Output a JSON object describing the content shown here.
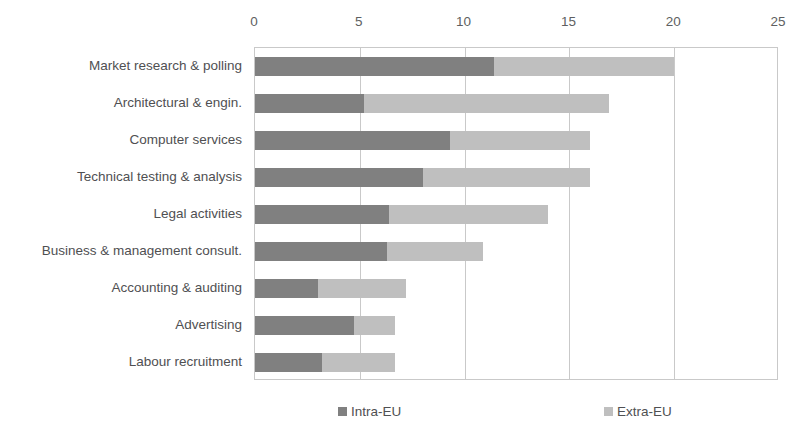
{
  "chart_data": {
    "type": "bar",
    "orientation": "horizontal",
    "stacked": true,
    "title": "",
    "xlabel": "",
    "ylabel": "",
    "xlim": [
      0,
      25
    ],
    "xticks": [
      0,
      5,
      10,
      15,
      20,
      25
    ],
    "xtick_labels": [
      "0",
      "5",
      "10",
      "15",
      "20",
      "25"
    ],
    "grid": "vertical",
    "axis_position": "top",
    "legend_position": "bottom",
    "categories": [
      "Market research & polling",
      "Architectural & engin.",
      "Computer services",
      "Technical testing & analysis",
      "Legal activities",
      "Business & management consult.",
      "Accounting & auditing",
      "Advertising",
      "Labour recruitment"
    ],
    "series": [
      {
        "name": "Intra-EU",
        "color": "#808080",
        "values": [
          11.4,
          5.2,
          9.3,
          8.0,
          6.4,
          6.3,
          3.0,
          4.7,
          3.2
        ]
      },
      {
        "name": "Extra-EU",
        "color": "#bfbfbf",
        "values": [
          8.6,
          11.7,
          6.7,
          8.0,
          7.6,
          4.6,
          4.2,
          2.0,
          3.5
        ]
      }
    ],
    "totals": [
      20.0,
      16.9,
      16.0,
      16.0,
      14.0,
      10.9,
      7.2,
      6.7,
      6.7
    ]
  },
  "legend": {
    "items": [
      {
        "label": "Intra-EU",
        "color": "#808080"
      },
      {
        "label": "Extra-EU",
        "color": "#bfbfbf"
      }
    ]
  },
  "colors": {
    "intra_eu": "#808080",
    "extra_eu": "#bfbfbf",
    "gridline": "#c9c9c9",
    "text": "#58595b",
    "background": "#ffffff"
  }
}
